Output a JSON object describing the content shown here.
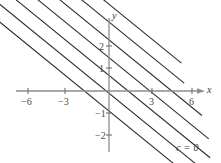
{
  "figure": {
    "title": "",
    "background_color": "#ffffff",
    "width": 221,
    "height": 163
  },
  "axes": {
    "x_axis_label": "x",
    "y_axis_label": "y",
    "axis_color": "#8c8c8c",
    "x_ticks": [
      {
        "value": -6,
        "label": "−6",
        "px": 28
      },
      {
        "value": -3,
        "label": "−3",
        "px": 65
      },
      {
        "value": 3,
        "label": "3",
        "px": 152
      },
      {
        "value": 6,
        "label": "6",
        "px": 192
      }
    ],
    "y_ticks": [
      {
        "value": 2,
        "label": "2",
        "py": 46
      },
      {
        "value": 1,
        "label": "1",
        "py": 68
      },
      {
        "value": -1,
        "label": "−1",
        "py": 113
      },
      {
        "value": -2,
        "label": "−2",
        "py": 135
      }
    ],
    "origin_px": {
      "x": 109,
      "y": 91
    }
  },
  "annotations": [
    {
      "name": "level-zero-label",
      "text": "c = 0",
      "x": 176,
      "y": 148
    }
  ],
  "chart_data": {
    "type": "line",
    "title": "",
    "xlabel": "x",
    "ylabel": "y",
    "xlim": [
      -8.5,
      7.8
    ],
    "ylim": [
      -3.6,
      3.4
    ],
    "grid": false,
    "legend": null,
    "line_color": "#2b2b2b",
    "slope": -0.5,
    "series": [
      {
        "name": "c = 6",
        "intercept": 3.9,
        "x_start": -2.2,
        "x_end": 5.3
      },
      {
        "name": "c = 5",
        "intercept": 3.1,
        "x_start": -6.4,
        "x_end": 5.5
      },
      {
        "name": "c = 4",
        "intercept": 2.3,
        "x_start": -7.3,
        "x_end": 6.8
      },
      {
        "name": "c = 3",
        "intercept": 1.5,
        "x_start": -7.4,
        "x_end": 7.3
      },
      {
        "name": "c = 2",
        "intercept": 0.7,
        "x_start": -8.2,
        "x_end": 7.4
      },
      {
        "name": "c = 1",
        "intercept": -0.1,
        "x_start": -8.2,
        "x_end": 7.4
      },
      {
        "name": "c = 0",
        "intercept": -0.9,
        "x_start": -8.2,
        "x_end": 7.4
      }
    ]
  }
}
